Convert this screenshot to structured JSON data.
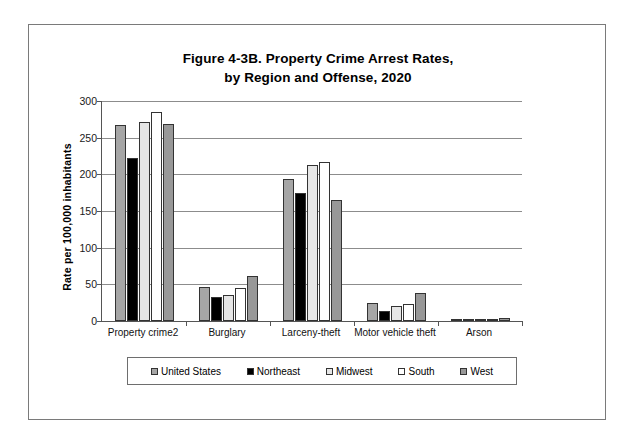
{
  "figure": {
    "title_line1": "Figure 4-3B. Property Crime Arrest Rates,",
    "title_line2": "by Region and Offense, 2020"
  },
  "axis": {
    "y_title": "Rate per 100,000 inhabitants",
    "y_ticks": [
      "0",
      "50",
      "100",
      "150",
      "200",
      "250",
      "300"
    ]
  },
  "legend": {
    "items": [
      {
        "label": "United States",
        "color": "#a6a6a6"
      },
      {
        "label": "Northeast",
        "color": "#000000"
      },
      {
        "label": "Midwest",
        "color": "#e6e6e6"
      },
      {
        "label": "South",
        "color": "#ffffff"
      },
      {
        "label": "West",
        "color": "#989898"
      }
    ]
  },
  "chart_data": {
    "type": "bar",
    "title": "Figure 4-3B. Property Crime Arrest Rates, by Region and Offense, 2020",
    "xlabel": "",
    "ylabel": "Rate per 100,000 inhabitants",
    "ylim": [
      0,
      300
    ],
    "ytick_step": 50,
    "grid": true,
    "legend_position": "bottom",
    "categories": [
      "Property crime2",
      "Burglary",
      "Larceny-theft",
      "Motor vehicle theft",
      "Arson"
    ],
    "series": [
      {
        "name": "United States",
        "color": "#a6a6a6",
        "values": [
          267,
          46,
          193,
          25,
          2
        ]
      },
      {
        "name": "Northeast",
        "color": "#000000",
        "values": [
          222,
          33,
          174,
          14,
          1
        ]
      },
      {
        "name": "Midwest",
        "color": "#e6e6e6",
        "values": [
          272,
          35,
          213,
          21,
          2
        ]
      },
      {
        "name": "South",
        "color": "#ffffff",
        "values": [
          285,
          45,
          217,
          23,
          2
        ]
      },
      {
        "name": "West",
        "color": "#989898",
        "values": [
          268,
          61,
          165,
          38,
          4
        ]
      }
    ]
  }
}
